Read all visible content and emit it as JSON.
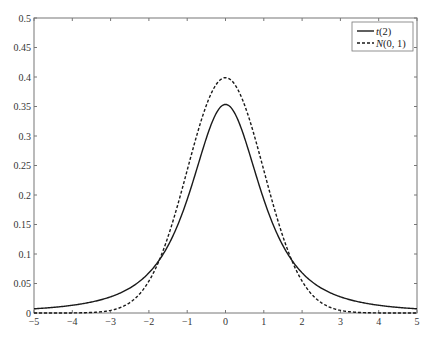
{
  "chart_data": {
    "type": "line",
    "title": "",
    "xlabel": "",
    "ylabel": "",
    "xlim": [
      -5,
      5
    ],
    "ylim": [
      0,
      0.5
    ],
    "grid": false,
    "legend_position": "upper right",
    "x_ticks": [
      "-5",
      "-4",
      "-3",
      "-2",
      "-1",
      "0",
      "1",
      "2",
      "3",
      "4",
      "5"
    ],
    "y_ticks": [
      "0",
      "0.05",
      "0.1",
      "0.15",
      "0.2",
      "0.25",
      "0.3",
      "0.35",
      "0.4",
      "0.45",
      "0.5"
    ],
    "x": [
      -5,
      -4,
      -3,
      -2,
      -1.5,
      -1,
      -0.5,
      0,
      0.5,
      1,
      1.5,
      2,
      3,
      4,
      5
    ],
    "series": [
      {
        "name": "t(2)",
        "style": "solid",
        "color": "#1a1a1a",
        "values": [
          0.0071,
          0.0131,
          0.0274,
          0.068,
          0.1067,
          0.1925,
          0.2962,
          0.3536,
          0.2962,
          0.1925,
          0.1067,
          0.068,
          0.0274,
          0.0131,
          0.0071
        ]
      },
      {
        "name": "N(0, 1)",
        "style": "dashed",
        "color": "#1a1a1a",
        "values": [
          1.5e-06,
          0.0001,
          0.0044,
          0.054,
          0.1295,
          0.242,
          0.3521,
          0.3989,
          0.3521,
          0.242,
          0.1295,
          0.054,
          0.0044,
          0.0001,
          1.5e-06
        ]
      }
    ]
  },
  "legend": {
    "items": [
      {
        "label_italic": "t",
        "label_rest": "(2)"
      },
      {
        "label_italic": "N",
        "label_rest": "(0, 1)"
      }
    ]
  }
}
